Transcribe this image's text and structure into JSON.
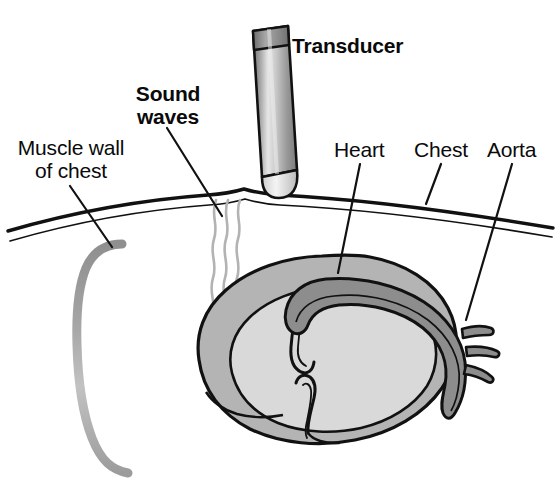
{
  "figure": {
    "background_color": "#ffffff",
    "width": 560,
    "height": 481
  },
  "labels": {
    "muscle_wall_line1": "Muscle wall",
    "muscle_wall_line2": "of chest",
    "sound_waves_line1": "Sound",
    "sound_waves_line2": "waves",
    "transducer": "Transducer",
    "heart": "Heart",
    "chest": "Chest",
    "aorta": "Aorta"
  },
  "colors": {
    "outline": "#111111",
    "text": "#0a0a0a",
    "heart_chamber_fill": "#d9d9d9",
    "heart_wall_fill": "#b4b4b4",
    "aorta_fill": "#8d8d8d",
    "muscle_wall_stroke": "#9a9a9a",
    "sound_wave_stroke": "#b0b0b0",
    "transducer_light": "#e8e8e8",
    "transducer_mid": "#a8a8a8",
    "transducer_dark": "#6f6f6f",
    "transducer_cap": "#8f8f8f",
    "transducer_tip": "#efefef"
  },
  "parts": {
    "transducer_name": "ultrasound-transducer-probe",
    "sound_waves_count": 3,
    "aorta_branch_count": 3,
    "chest_wall_lines": 2
  }
}
